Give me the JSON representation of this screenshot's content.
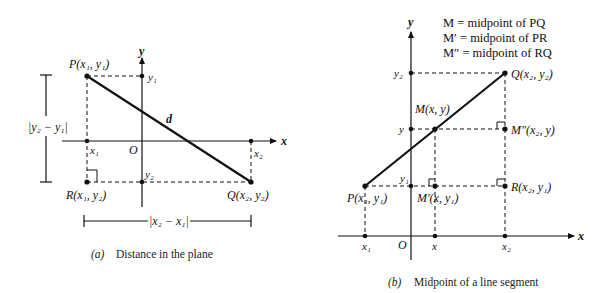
{
  "diagram_a": {
    "caption_prefix": "(a)",
    "caption": "Distance in the plane",
    "axis_x_label": "x",
    "axis_y_label": "y",
    "origin_label": "O",
    "point_P": "P(x₁, y₁)",
    "point_Q": "Q(x₂, y₂)",
    "point_R": "R(x₁, y₂)",
    "tick_x1": "x₁",
    "tick_x2": "x₂",
    "tick_y1": "y₁",
    "tick_y2": "y₂",
    "distance_label": "d",
    "vertical_measure": "|y₂ − y₁|",
    "horizontal_measure": "|x₂ − x₁|"
  },
  "diagram_b": {
    "caption_prefix": "(b)",
    "caption": "Midpoint of a line segment",
    "axis_x_label": "x",
    "axis_y_label": "y",
    "origin_label": "O",
    "legend": [
      "M = midpoint of PQ",
      "M′ = midpoint of PR",
      "M″ = midpoint of RQ"
    ],
    "point_P": "P(x₁, y₁)",
    "point_Q": "Q(x₂, y₂)",
    "point_R": "R(x₂, y₁)",
    "point_M": "M(x, y)",
    "point_M1": "M′(x, y₁)",
    "point_M2": "M″(x₂, y)",
    "tick_x1": "x₁",
    "tick_x": "x",
    "tick_x2": "x₂",
    "tick_y1": "y₁",
    "tick_y": "y",
    "tick_y2": "y₂"
  }
}
